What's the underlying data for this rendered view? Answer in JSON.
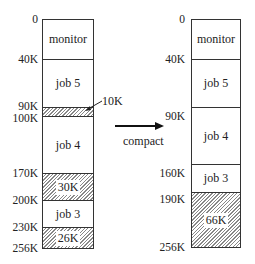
{
  "before": {
    "ticks": [
      "0",
      "40K",
      "90K",
      "100K",
      "170K",
      "200K",
      "230K",
      "256K"
    ],
    "segments": [
      {
        "label": "monitor",
        "free": false
      },
      {
        "label": "job 5",
        "free": false
      },
      {
        "label": "",
        "free": true
      },
      {
        "label": "job 4",
        "free": false
      },
      {
        "label": "30K",
        "free": true
      },
      {
        "label": "job 3",
        "free": false
      },
      {
        "label": "26K",
        "free": true
      }
    ],
    "hole_callout": "10K"
  },
  "arrow_label": "compact",
  "after": {
    "ticks": [
      "0",
      "40K",
      "90K",
      "160K",
      "190K",
      "256K"
    ],
    "segments": [
      {
        "label": "monitor",
        "free": false
      },
      {
        "label": "job 5",
        "free": false
      },
      {
        "label": "job 4",
        "free": false
      },
      {
        "label": "job 3",
        "free": false
      },
      {
        "label": "66K",
        "free": true
      }
    ]
  }
}
